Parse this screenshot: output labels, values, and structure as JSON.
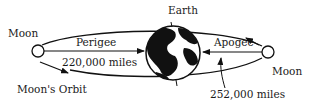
{
  "diagram": {
    "labels": {
      "moon_left": "Moon",
      "moon_right": "Moon",
      "earth": "Earth",
      "perigee": "Perigee",
      "apogee": "Apogee",
      "perigee_distance": "220,000 miles",
      "apogee_distance": "252,000 miles",
      "orbit": "Moon's Orbit"
    },
    "colors": {
      "ink": "#111111",
      "background": "#ffffff"
    }
  }
}
